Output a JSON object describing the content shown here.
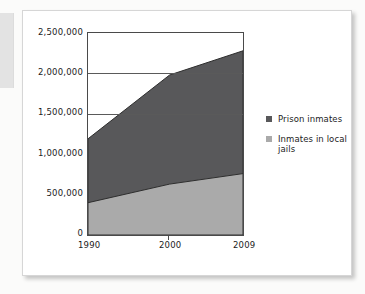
{
  "chart_data": {
    "type": "area",
    "stacked": true,
    "title": "",
    "xlabel": "",
    "ylabel": "",
    "x": [
      1990,
      2000,
      2009
    ],
    "xtick_labels": [
      "1990",
      "2000",
      "2009"
    ],
    "xlim": [
      1990,
      2009
    ],
    "ylim": [
      0,
      2500000
    ],
    "ytick_labels": [
      "0",
      "500,000",
      "1,000,000",
      "1,500,000",
      "2,000,000",
      "2,500,000"
    ],
    "ytick_values": [
      0,
      500000,
      1000000,
      1500000,
      2000000,
      2500000
    ],
    "grid": "horizontal-only",
    "legend_position": "right",
    "series": [
      {
        "name": "Prison inmates",
        "color": "#58585a",
        "values": [
          790000,
          1350000,
          1520000
        ],
        "cumulative_top": [
          1190000,
          1980000,
          2280000
        ]
      },
      {
        "name": "Inmates in local jails",
        "color": "#aaaaaa",
        "values": [
          400000,
          630000,
          760000
        ],
        "cumulative_top": [
          400000,
          630000,
          760000
        ]
      }
    ],
    "annotations": []
  },
  "legend": {
    "items": [
      {
        "label": "Prison inmates",
        "color": "#58585a"
      },
      {
        "label": "Inmates in local jails",
        "color": "#aaaaaa"
      }
    ]
  },
  "colors": {
    "page_background": "#fbfbfa",
    "card_background": "#ffffff",
    "card_border": "#d6d6d6",
    "axis": "#4a4a4a",
    "gridline": "#5a5a5a",
    "text": "#1c1c1c",
    "prison_area": "#58585a",
    "jail_area": "#aaaaaa",
    "left_tab": "#e3e3e3"
  }
}
